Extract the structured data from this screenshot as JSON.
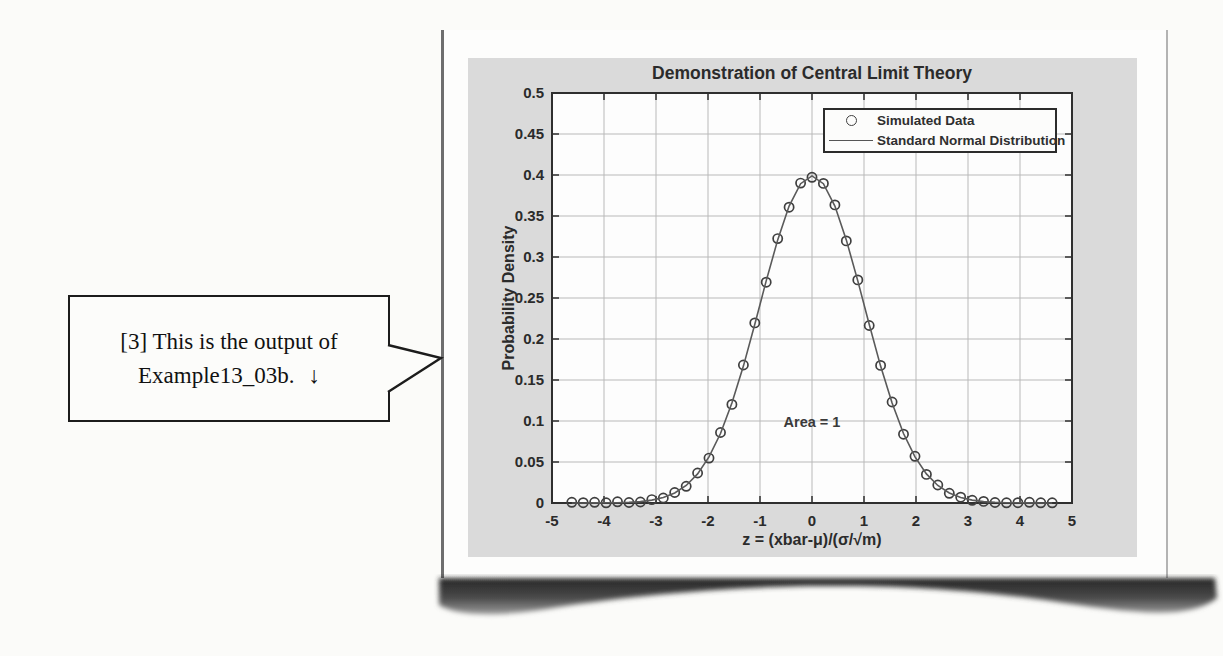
{
  "callout": {
    "line1": "[3] This is the output of",
    "line2": "Example13_03b.",
    "arrow": "↓"
  },
  "colors": {
    "panel_bg": "#dadada",
    "plot_bg": "#fdfdfd",
    "grid": "#b9b9b9",
    "axis": "#2f2f2f",
    "curve": "#5a5a5a",
    "marker": "#3f3f3f",
    "text": "#2b2b2b"
  },
  "chart_data": {
    "type": "line+scatter",
    "title": "Demonstration of Central Limit Theory",
    "xlabel": "z = (xbar-μ)/(σ/√m)",
    "ylabel": "Probability Density",
    "xlim": [
      -5,
      5
    ],
    "ylim": [
      0,
      0.5
    ],
    "grid": true,
    "legend_position": "top-right",
    "xticks": [
      -5,
      -4,
      -3,
      -2,
      -1,
      0,
      1,
      2,
      3,
      4,
      5
    ],
    "xtick_labels": [
      "-5",
      "-4",
      "-3",
      "-2",
      "-1",
      "0",
      "1",
      "2",
      "3",
      "4",
      "5"
    ],
    "yticks": [
      0,
      0.05,
      0.1,
      0.15,
      0.2,
      0.25,
      0.3,
      0.35,
      0.4,
      0.45,
      0.5
    ],
    "ytick_labels": [
      "0",
      "0.05",
      "0.1",
      "0.15",
      "0.2",
      "0.25",
      "0.3",
      "0.35",
      "0.4",
      "0.45",
      "0.5"
    ],
    "annotation": {
      "text": "Area = 1",
      "x": 0,
      "y": 0.098
    },
    "x": [
      -4.62,
      -4.4,
      -4.18,
      -3.96,
      -3.74,
      -3.52,
      -3.3,
      -3.08,
      -2.86,
      -2.64,
      -2.42,
      -2.2,
      -1.98,
      -1.76,
      -1.54,
      -1.32,
      -1.1,
      -0.88,
      -0.66,
      -0.44,
      -0.22,
      0,
      0.22,
      0.44,
      0.66,
      0.88,
      1.1,
      1.32,
      1.54,
      1.76,
      1.98,
      2.2,
      2.42,
      2.64,
      2.86,
      3.08,
      3.3,
      3.52,
      3.74,
      3.96,
      4.18,
      4.4,
      4.62
    ],
    "series": [
      {
        "name": "Simulated Data",
        "type": "scatter",
        "marker": "circle",
        "y": [
          0.0008,
          0.0004,
          0.0009,
          0.0003,
          0.0015,
          0.0006,
          0.0012,
          0.0042,
          0.0061,
          0.0128,
          0.0204,
          0.0366,
          0.0548,
          0.086,
          0.1202,
          0.1683,
          0.2196,
          0.2693,
          0.3224,
          0.3607,
          0.3901,
          0.3972,
          0.3898,
          0.3635,
          0.3196,
          0.2721,
          0.2165,
          0.1678,
          0.1232,
          0.0839,
          0.057,
          0.0349,
          0.0219,
          0.0118,
          0.0071,
          0.0033,
          0.0019,
          0.0006,
          0.0003,
          0.0004,
          0.0008,
          0.0002,
          0.0003
        ]
      },
      {
        "name": "Standard Normal Distribution",
        "type": "line",
        "y": [
          0.0,
          0.0,
          0.0001,
          0.0002,
          0.0004,
          0.0008,
          0.0017,
          0.0035,
          0.0067,
          0.0122,
          0.0213,
          0.0355,
          0.0562,
          0.0848,
          0.1219,
          0.1669,
          0.2179,
          0.2709,
          0.3209,
          0.3621,
          0.3894,
          0.3989,
          0.3894,
          0.3621,
          0.3209,
          0.2709,
          0.2179,
          0.1669,
          0.1219,
          0.0848,
          0.0562,
          0.0355,
          0.0213,
          0.0122,
          0.0067,
          0.0035,
          0.0017,
          0.0008,
          0.0004,
          0.0002,
          0.0001,
          0.0,
          0.0
        ]
      }
    ]
  }
}
